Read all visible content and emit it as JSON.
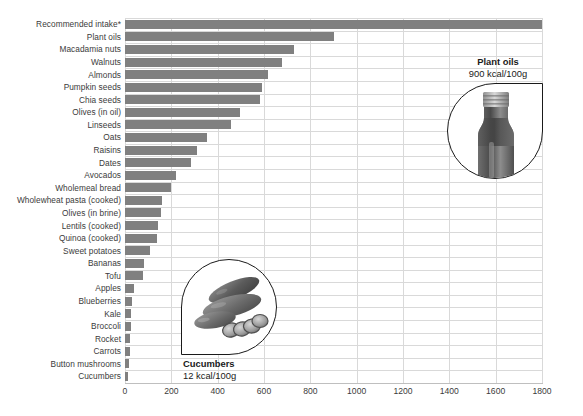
{
  "chart_data": {
    "type": "bar",
    "orientation": "horizontal",
    "title": "",
    "xlabel": "",
    "ylabel": "",
    "xlim": [
      0,
      1800
    ],
    "xticks": [
      0,
      200,
      400,
      600,
      800,
      1000,
      1200,
      1400,
      1600,
      1800
    ],
    "grid": true,
    "legend": "none",
    "bar_color": "#808080",
    "categories": [
      "Recommended intake*",
      "Plant oils",
      "Macadamia nuts",
      "Walnuts",
      "Almonds",
      "Pumpkin seeds",
      "Chia seeds",
      "Olives (in oil)",
      "Linseeds",
      "Oats",
      "Raisins",
      "Dates",
      "Avocados",
      "Wholemeal bread",
      "Wholewheat pasta (cooked)",
      "Olives (in brine)",
      "Lentils (cooked)",
      "Quinoa (cooked)",
      "Sweet potatoes",
      "Bananas",
      "Tofu",
      "Apples",
      "Blueberries",
      "Kale",
      "Broccoli",
      "Rocket",
      "Carrots",
      "Button mushrooms",
      "Cucumbers"
    ],
    "values": [
      1800,
      900,
      730,
      678,
      617,
      591,
      583,
      496,
      457,
      354,
      311,
      285,
      220,
      198,
      160,
      156,
      143,
      138,
      108,
      82,
      76,
      39,
      30,
      28,
      26,
      22,
      22,
      16,
      12
    ],
    "units": "kcal/100g"
  },
  "callouts": [
    {
      "id": "plant-oils",
      "title": "Plant oils",
      "value": "900 kcal/100g",
      "icon": "oil-bottle-icon"
    },
    {
      "id": "cucumbers",
      "title": "Cucumbers",
      "value": "12 kcal/100g",
      "icon": "cucumbers-icon"
    }
  ],
  "colors": {
    "bar": "#808080",
    "gridline": "#d9d9d9",
    "axis": "#bfbfbf",
    "text": "#3b3b3b",
    "callout_text": "#1a1a1a"
  }
}
